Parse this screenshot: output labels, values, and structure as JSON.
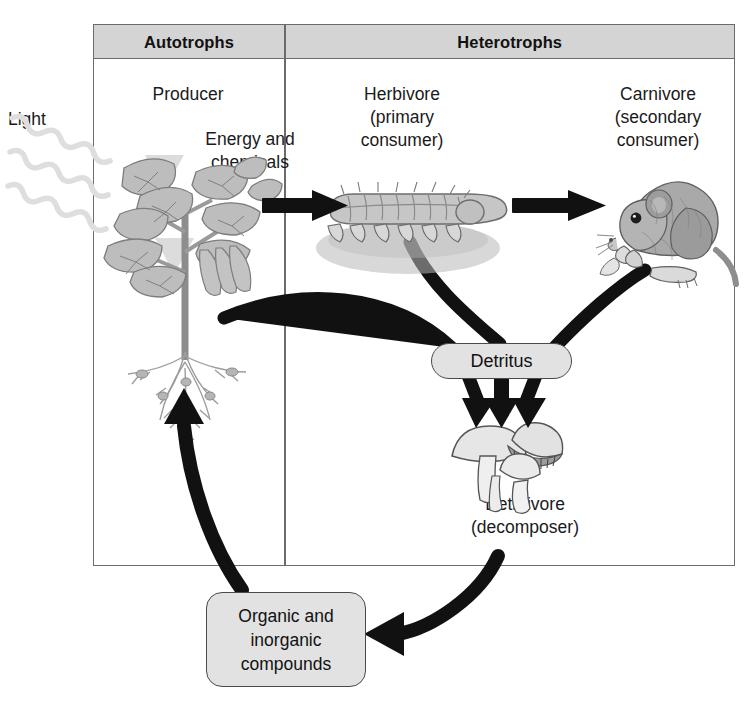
{
  "diagram": {
    "columns": {
      "autotrophs": "Autotrophs",
      "heterotrophs": "Heterotrophs"
    },
    "labels": {
      "light": "Light",
      "producer": "Producer",
      "energy_chemicals": "Energy and\nchemicals",
      "herbivore": "Herbivore\n(primary\nconsumer)",
      "carnivore": "Carnivore\n(secondary\nconsumer)",
      "detritivore": "Detritivore\n(decomposer)"
    },
    "boxes": {
      "detritus": "Detritus",
      "compounds": "Organic and\ninorganic\ncompounds"
    },
    "organisms": [
      {
        "name": "plant",
        "role": "Producer",
        "column": "Autotrophs"
      },
      {
        "name": "caterpillar",
        "role": "Herbivore (primary consumer)",
        "column": "Heterotrophs"
      },
      {
        "name": "mouse",
        "role": "Carnivore (secondary consumer)",
        "column": "Heterotrophs"
      },
      {
        "name": "mushrooms",
        "role": "Detritivore (decomposer)",
        "column": "Heterotrophs"
      }
    ],
    "flows": [
      {
        "from": "light",
        "to": "plant",
        "style": "wavy",
        "color": "#d9d9d9"
      },
      {
        "from": "plant",
        "to": "caterpillar",
        "style": "straight-arrow",
        "label": "Energy and chemicals"
      },
      {
        "from": "caterpillar",
        "to": "mouse",
        "style": "straight-arrow"
      },
      {
        "from": "plant",
        "to": "detritus",
        "style": "curve"
      },
      {
        "from": "caterpillar",
        "to": "detritus",
        "style": "curve"
      },
      {
        "from": "mouse",
        "to": "detritus",
        "style": "curve"
      },
      {
        "from": "detritus",
        "to": "mushrooms",
        "style": "arrow-triple"
      },
      {
        "from": "mushrooms",
        "to": "compounds",
        "style": "curve-arrow"
      },
      {
        "from": "compounds",
        "to": "plant",
        "style": "curve-arrow"
      }
    ],
    "colors": {
      "frame_border": "#6b6b6b",
      "header_fill": "#d4d4d4",
      "box_fill": "#e2e2e2",
      "box_border": "#4a4a4a",
      "arrow": "#111111",
      "light_ray": "#d9d9d9"
    }
  }
}
